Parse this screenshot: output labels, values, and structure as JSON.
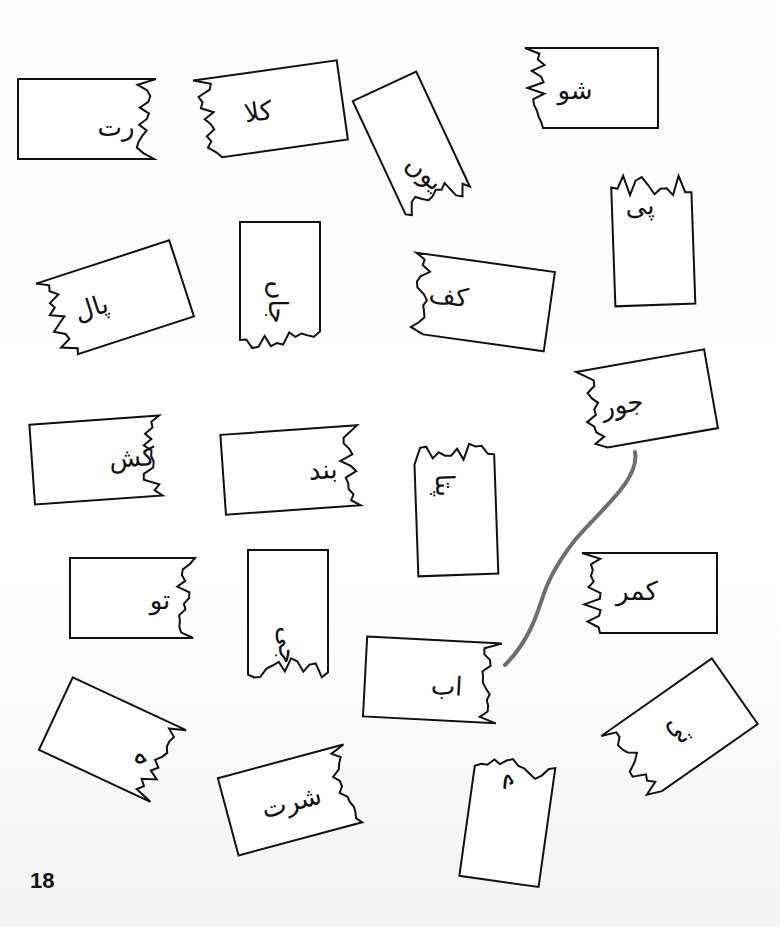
{
  "worksheet": {
    "page_number": "18",
    "line_color": "#6e6e6e",
    "cards": [
      {
        "id": "c1",
        "text": "رت",
        "x": 18,
        "y": 79,
        "w": 138,
        "h": 80,
        "rot": 0,
        "torn": "right",
        "tx": 98,
        "ty": 48
      },
      {
        "id": "c2",
        "text": "کلا",
        "x": 198,
        "y": 70,
        "w": 145,
        "h": 80,
        "rot": -8,
        "torn": "left",
        "tx": 60,
        "ty": 40
      },
      {
        "id": "c3",
        "text": "یوں",
        "x": 378,
        "y": 80,
        "w": 70,
        "h": 135,
        "rot": -25,
        "torn": "bottom",
        "tx": 35,
        "ty": 95,
        "trot": 65
      },
      {
        "id": "c4",
        "text": "شو",
        "x": 525,
        "y": 48,
        "w": 133,
        "h": 80,
        "rot": 0,
        "torn": "left",
        "tx": 50,
        "ty": 42
      },
      {
        "id": "c5",
        "text": "پی",
        "x": 613,
        "y": 170,
        "w": 80,
        "h": 135,
        "rot": -2,
        "torn": "top",
        "tx": 28,
        "ty": 35
      },
      {
        "id": "c6",
        "text": "پال",
        "x": 45,
        "y": 260,
        "w": 140,
        "h": 80,
        "rot": -18,
        "torn": "left",
        "tx": 45,
        "ty": 40
      },
      {
        "id": "c7",
        "text": "جاں",
        "x": 240,
        "y": 222,
        "w": 80,
        "h": 130,
        "rot": 0,
        "torn": "bottom",
        "tx": 38,
        "ty": 80,
        "trot": 90
      },
      {
        "id": "c8",
        "text": "کف",
        "x": 410,
        "y": 262,
        "w": 140,
        "h": 80,
        "rot": 8,
        "torn": "left",
        "tx": 38,
        "ty": 38
      },
      {
        "id": "c9",
        "text": "جور",
        "x": 582,
        "y": 360,
        "w": 130,
        "h": 80,
        "rot": -10,
        "torn": "left",
        "tx": 40,
        "ty": 40
      },
      {
        "id": "c10",
        "text": "کش",
        "x": 32,
        "y": 420,
        "w": 130,
        "h": 80,
        "rot": -4,
        "torn": "right",
        "tx": 100,
        "ty": 40
      },
      {
        "id": "c11",
        "text": "بند",
        "x": 223,
        "y": 430,
        "w": 137,
        "h": 80,
        "rot": -4,
        "torn": "right",
        "tx": 100,
        "ty": 42
      },
      {
        "id": "c12",
        "text": "پتا",
        "x": 416,
        "y": 440,
        "w": 80,
        "h": 135,
        "rot": -2,
        "torn": "top",
        "tx": 30,
        "ty": 45,
        "trot": 90
      },
      {
        "id": "c13",
        "text": "تو",
        "x": 70,
        "y": 558,
        "w": 125,
        "h": 80,
        "rot": 0,
        "torn": "right",
        "tx": 90,
        "ty": 42
      },
      {
        "id": "c14",
        "text": "جی",
        "x": 248,
        "y": 550,
        "w": 80,
        "h": 130,
        "rot": 0,
        "torn": "bottom",
        "tx": 40,
        "ty": 95,
        "trot": 90
      },
      {
        "id": "c15",
        "text": "کمر",
        "x": 582,
        "y": 553,
        "w": 135,
        "h": 80,
        "rot": 0,
        "torn": "left",
        "tx": 55,
        "ty": 38
      },
      {
        "id": "c16",
        "text": "اب",
        "x": 365,
        "y": 640,
        "w": 135,
        "h": 80,
        "rot": 3,
        "torn": "right",
        "tx": 82,
        "ty": 45
      },
      {
        "id": "c17",
        "text": "ہ",
        "x": 50,
        "y": 700,
        "w": 125,
        "h": 80,
        "rot": 25,
        "torn": "right",
        "tx": 100,
        "ty": 45,
        "trot": 90
      },
      {
        "id": "c18",
        "text": "تی",
        "x": 612,
        "y": 690,
        "w": 135,
        "h": 80,
        "rot": -35,
        "torn": "left",
        "tx": 70,
        "ty": 40,
        "trot": 90
      },
      {
        "id": "c19",
        "text": "شرت",
        "x": 226,
        "y": 760,
        "w": 130,
        "h": 80,
        "rot": -15,
        "torn": "right",
        "tx": 65,
        "ty": 42
      },
      {
        "id": "c20",
        "text": "ے",
        "x": 468,
        "y": 752,
        "w": 80,
        "h": 130,
        "rot": 8,
        "torn": "top",
        "tx": 40,
        "ty": 30,
        "trot": 90
      }
    ]
  }
}
